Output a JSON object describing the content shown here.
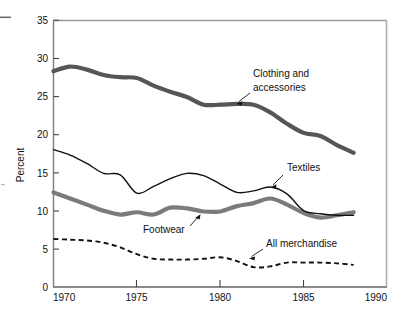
{
  "chart_data": {
    "type": "line",
    "title": "",
    "subtitle": "",
    "xlabel": "",
    "ylabel": "Percent",
    "xlim": [
      1970,
      1990
    ],
    "ylim": [
      0,
      35
    ],
    "xticks": [
      1970,
      1975,
      1980,
      1985,
      1990
    ],
    "yticks": [
      0,
      5,
      10,
      15,
      20,
      25,
      30,
      35
    ],
    "xtick_labels": [
      "1970",
      "1975",
      "1980",
      "1985",
      "1990"
    ],
    "ytick_labels": [
      "0",
      "5",
      "10",
      "15",
      "20",
      "25",
      "30",
      "35"
    ],
    "grid": false,
    "legend": "inline-annotations",
    "x": [
      1970,
      1971,
      1972,
      1973,
      1974,
      1975,
      1976,
      1977,
      1978,
      1979,
      1980,
      1981,
      1982,
      1983,
      1984,
      1985,
      1986,
      1987,
      1988
    ],
    "series": [
      {
        "name": "Clothing and accessories",
        "style": "thick-gray-solid",
        "color": "#565656",
        "values": [
          28.3,
          28.9,
          28.5,
          27.8,
          27.5,
          27.4,
          26.4,
          25.6,
          24.9,
          23.9,
          23.9,
          24.0,
          23.9,
          22.9,
          21.4,
          20.2,
          19.8,
          18.6,
          17.6
        ]
      },
      {
        "name": "Textiles",
        "style": "thin-black-solid",
        "color": "#111111",
        "values": [
          18.0,
          17.3,
          16.2,
          14.9,
          14.7,
          12.3,
          13.2,
          14.2,
          14.9,
          14.6,
          13.5,
          12.4,
          12.6,
          13.1,
          12.2,
          10.0,
          9.6,
          9.4,
          9.4
        ]
      },
      {
        "name": "Footwear",
        "style": "thick-gray-solid",
        "color": "#7b7b7b",
        "values": [
          12.4,
          11.6,
          10.8,
          10.0,
          9.5,
          9.8,
          9.5,
          10.4,
          10.3,
          9.9,
          9.9,
          10.6,
          11.0,
          11.6,
          10.8,
          9.7,
          9.1,
          9.4,
          9.8
        ]
      },
      {
        "name": "All merchandise",
        "style": "black-dashed",
        "color": "#111111",
        "values": [
          6.3,
          6.2,
          6.1,
          5.8,
          5.2,
          4.3,
          3.7,
          3.6,
          3.6,
          3.7,
          3.9,
          3.4,
          2.6,
          2.7,
          3.2,
          3.2,
          3.2,
          3.1,
          2.9
        ]
      }
    ],
    "annotations": [
      {
        "label": "Clothing and accessories",
        "line1": "Clothing and",
        "line2": "accessories",
        "text_x": 253,
        "text_y": 73,
        "arrow_from_x": 250,
        "arrow_from_y": 93,
        "arrow_to_x": 237,
        "arrow_to_y": 103
      },
      {
        "label": "Textiles",
        "line1": "Textiles",
        "line2": "",
        "text_x": 285,
        "text_y": 167,
        "arrow_from_x": 283,
        "arrow_from_y": 175,
        "arrow_to_x": 271,
        "arrow_to_y": 187
      },
      {
        "label": "Footwear",
        "line1": "Footwear",
        "line2": "",
        "text_x": 143,
        "text_y": 229,
        "arrow_from_x": 190,
        "arrow_from_y": 226,
        "arrow_to_x": 200,
        "arrow_to_y": 214
      },
      {
        "label": "All merchandise",
        "line1": "All merchandise",
        "line2": "",
        "text_x": 265,
        "text_y": 243,
        "arrow_from_x": 263,
        "arrow_from_y": 249,
        "arrow_to_x": 249,
        "arrow_to_y": 258
      }
    ]
  },
  "axes": {
    "y_axis_title": "Percent",
    "y_tick_0": "0",
    "y_tick_5": "5",
    "y_tick_10": "10",
    "y_tick_15": "15",
    "y_tick_20": "20",
    "y_tick_25": "25",
    "y_tick_30": "30",
    "y_tick_35": "35",
    "x_tick_1970": "1970",
    "x_tick_1975": "1975",
    "x_tick_1980": "1980",
    "x_tick_1985": "1985",
    "x_tick_1990": "1990"
  },
  "labels": {
    "clothing_line1": "Clothing and",
    "clothing_line2": "accessories",
    "textiles": "Textiles",
    "footwear": "Footwear",
    "all_merchandise": "All merchandise"
  },
  "colors": {
    "clothing": "#565656",
    "textiles": "#111111",
    "footwear": "#7b7b7b",
    "all_merchandise": "#111111",
    "frame": "#8d8d8d",
    "background": "#ffffff"
  }
}
